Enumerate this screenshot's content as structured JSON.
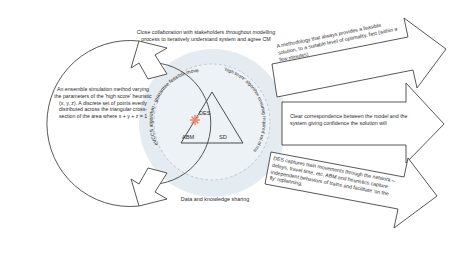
{
  "diagram": {
    "colors": {
      "stroke": "#3a3a3a",
      "text": "#2b2b2b",
      "circle_fill": "#dfe7ef",
      "dashed_circle": "#b9b9b9",
      "marker": "#f4806a",
      "background": "#ffffff"
    },
    "left_cycle": {
      "name": "ensemble-simulation-loop",
      "body": "An ensemble simulation method varying the parameters of the 'high score' heuristic (x, y, z). A discrete set of points evenly distributed across the triangular cross-section of the area where x + y + z = 1"
    },
    "top_callout": {
      "name": "stakeholder-collaboration",
      "body": "Close collaboration with stakeholders throughout modelling process to iteratively understand system and agree CM"
    },
    "bottom_callout": {
      "name": "data-knowledge-sharing",
      "body": "Data and knowledge sharing"
    },
    "core": {
      "name": "hybrid-simulation-core",
      "triangle_vertices": [
        {
          "key": "des",
          "label": "DES",
          "position": "top"
        },
        {
          "key": "abm",
          "label": "ABM",
          "position": "bottom-left"
        },
        {
          "key": "sd",
          "label": "SD",
          "position": "bottom-right"
        }
      ],
      "marker_label": "operating-point-marker",
      "curved_labels": [
        {
          "key": "left",
          "text": "eVCCS algorithm - guarantee feasible movement"
        },
        {
          "key": "right",
          "text": "'high score' algorithm ensuring required vol of material at each destination"
        }
      ]
    },
    "outcome_arrows": [
      {
        "key": "top",
        "name": "outcome-arrow-methodology",
        "text": "A methodology that always provides a feasible solution, to a suitable level of optimality, fast (within a few minutes)"
      },
      {
        "key": "middle",
        "name": "outcome-arrow-correspondence",
        "text": "Clear correspondence between the model and the system giving confidence the solution will"
      },
      {
        "key": "bottom",
        "name": "outcome-arrow-des-capture",
        "text": "DES captures train movements through the network – delays, travel time, etc. ABM and heuristics capture independent behaviors of trains and facilitate 'on the fly' replanning."
      }
    ]
  }
}
